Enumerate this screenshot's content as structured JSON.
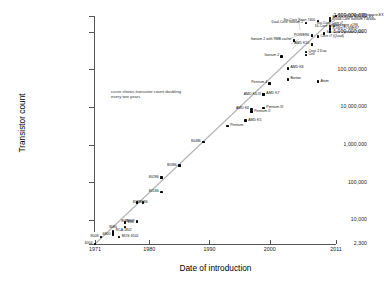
{
  "chart": {
    "y_axis_title": "Transistor count",
    "x_axis_title": "Date of introduction",
    "annotation": "curve shows transistor count doubling every two years",
    "y_tick_labels": [
      "2,600,000,000",
      "1,000,000,000",
      "100,000,000",
      "10,000,000",
      "1,000,000",
      "100,000",
      "10,000",
      "2,300"
    ],
    "x_tick_labels": [
      "1971",
      "1980",
      "1990",
      "2000",
      "2011"
    ],
    "accent_color": "#000000",
    "trend_color": "#b0b0b0",
    "axis_color": "#555555"
  },
  "chart_data": {
    "type": "scatter",
    "xlabel": "Date of introduction",
    "ylabel": "Transistor count",
    "xlim": [
      1971,
      2011
    ],
    "ylim": [
      2300,
      2600000000
    ],
    "yscale": "log",
    "grid": false,
    "legend": null,
    "annotations": [
      "curve shows transistor count doubling every two years"
    ],
    "yticks": [
      2300,
      10000,
      100000,
      1000000,
      10000000,
      100000000,
      1000000000,
      2600000000
    ],
    "ytick_labels": [
      "2,300",
      "10,000",
      "100,000",
      "1,000,000",
      "10,000,000",
      "100,000,000",
      "1,000,000,000",
      "2,600,000,000"
    ],
    "xticks": [
      1971,
      1980,
      1990,
      2000,
      2011
    ],
    "xtick_labels": [
      "1971",
      "1980",
      "1990",
      "2000",
      "2011"
    ],
    "trend_line": {
      "label": "Moore's law: doubling every two years",
      "from": [
        1971,
        2300
      ],
      "to": [
        2011,
        2600000000
      ]
    },
    "points": [
      {
        "name": "4004",
        "x": 1971,
        "y": 2300,
        "side": "left"
      },
      {
        "name": "8008",
        "x": 1972,
        "y": 3500,
        "side": "left"
      },
      {
        "name": "8080",
        "x": 1974,
        "y": 4500,
        "side": "top"
      },
      {
        "name": "RCA 1802",
        "x": 1974,
        "y": 5000,
        "side": "right"
      },
      {
        "name": "MOS 6502",
        "x": 1975,
        "y": 3510,
        "side": "right"
      },
      {
        "name": "6800",
        "x": 1974,
        "y": 4100,
        "side": "left"
      },
      {
        "name": "Z80",
        "x": 1976,
        "y": 8500,
        "side": "right"
      },
      {
        "name": "8085",
        "x": 1976,
        "y": 6500,
        "side": "top"
      },
      {
        "name": "8088",
        "x": 1979,
        "y": 29000,
        "side": "left"
      },
      {
        "name": "6809",
        "x": 1978,
        "y": 9000,
        "side": "left"
      },
      {
        "name": "8086",
        "x": 1978,
        "y": 29000,
        "side": "right"
      },
      {
        "name": "80186",
        "x": 1982,
        "y": 55000,
        "side": "left"
      },
      {
        "name": "80286",
        "x": 1982,
        "y": 134000,
        "side": "left"
      },
      {
        "name": "80386",
        "x": 1985,
        "y": 275000,
        "side": "left"
      },
      {
        "name": "80486",
        "x": 1989,
        "y": 1180000,
        "side": "left"
      },
      {
        "name": "Pentium",
        "x": 1993,
        "y": 3100000,
        "side": "right"
      },
      {
        "name": "AMD K5",
        "x": 1996,
        "y": 4300000,
        "side": "right"
      },
      {
        "name": "Pentium II",
        "x": 1997,
        "y": 7500000,
        "side": "right"
      },
      {
        "name": "AMD K6",
        "x": 1997,
        "y": 8800000,
        "side": "left"
      },
      {
        "name": "Pentium III",
        "x": 1999,
        "y": 9500000,
        "side": "right"
      },
      {
        "name": "AMD K6-III",
        "x": 1999,
        "y": 21300000,
        "side": "left"
      },
      {
        "name": "AMD K7",
        "x": 1999,
        "y": 22000000,
        "side": "right"
      },
      {
        "name": "Pentium 4",
        "x": 2000,
        "y": 42000000,
        "side": "left"
      },
      {
        "name": "Barton",
        "x": 2003,
        "y": 54300000,
        "side": "right"
      },
      {
        "name": "Atom",
        "x": 2008,
        "y": 47000000,
        "side": "right"
      },
      {
        "name": "AMD K8",
        "x": 2003,
        "y": 105900000,
        "side": "right"
      },
      {
        "name": "Itanium 2",
        "x": 2002,
        "y": 220000000,
        "side": "left"
      },
      {
        "name": "Cell",
        "x": 2006,
        "y": 241000000,
        "side": "right"
      },
      {
        "name": "Core 2 Duo",
        "x": 2006,
        "y": 291000000,
        "side": "right"
      },
      {
        "name": "Itanium 2 with 9MB cache",
        "x": 2004,
        "y": 592000000,
        "side": "left"
      },
      {
        "name": "AMD K10",
        "x": 2007,
        "y": 463000000,
        "side": "left"
      },
      {
        "name": "POWER6",
        "x": 2007,
        "y": 789000000,
        "side": "left"
      },
      {
        "name": "Core i7 (Quad)",
        "x": 2008,
        "y": 731000000,
        "side": "right"
      },
      {
        "name": "Dual-Core Itanium 2",
        "x": 2006,
        "y": 1700000000,
        "side": "left"
      },
      {
        "name": "Six-Core Xeon 7400",
        "x": 2008,
        "y": 1900000000,
        "side": "left"
      },
      {
        "name": "Six-Core Core i7",
        "x": 2010,
        "y": 1170000000,
        "side": "top"
      },
      {
        "name": "Six-Core Opteron 2400",
        "x": 2009,
        "y": 904000000,
        "side": "right"
      },
      {
        "name": "8-core POWER7",
        "x": 2010,
        "y": 1200000000,
        "side": "right"
      },
      {
        "name": "Quad-core z196",
        "x": 2010,
        "y": 1400000000,
        "side": "right"
      },
      {
        "name": "Quad-Core Itanium Tukwila",
        "x": 2010,
        "y": 2000000000,
        "side": "right"
      },
      {
        "name": "8-Core Xeon Nehalem-EX",
        "x": 2010,
        "y": 2300000000,
        "side": "right"
      },
      {
        "name": "10-Core Xeon Westmere-EX",
        "x": 2011,
        "y": 2600000000,
        "side": "right"
      },
      {
        "name": "16-Core SPARC T3",
        "x": 2010,
        "y": 1000000000,
        "side": "top"
      }
    ]
  }
}
